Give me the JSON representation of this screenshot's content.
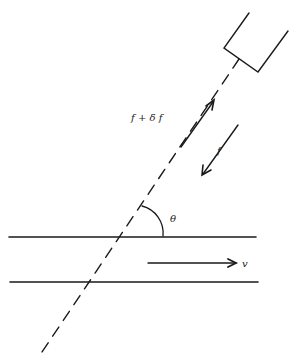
{
  "diagram": {
    "type": "doppler-flow-geometry",
    "labels": {
      "reflected_frequency": "f + δ f",
      "transmitted_frequency": "f",
      "angle": "θ",
      "velocity": "v"
    },
    "colors": {
      "background": "#ffffff",
      "stroke": "#1a1a1a"
    },
    "elements": {
      "transducer": "rectangular probe at upper right",
      "beam": "dashed line from transducer through vessel",
      "vessel": "two parallel horizontal walls",
      "arrows": [
        "upward arrow (f + δ f)",
        "downward arrow (f)",
        "flow arrow (v)"
      ]
    }
  }
}
